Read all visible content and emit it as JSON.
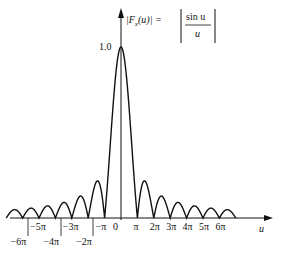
{
  "chart_data": {
    "type": "line",
    "xlabel": "u",
    "ylabel": "|F_x(u)|",
    "ylim": [
      0,
      1.0
    ],
    "xlim": [
      -7,
      7
    ],
    "x_unit": "pi",
    "grid": false,
    "legend": "none",
    "y_tick_labels": [
      "1.0"
    ],
    "x_tick_labels_upper": [
      "−5π",
      "−3π",
      "−π",
      "0",
      "π",
      "2π",
      "3π",
      "4π",
      "5π",
      "6π"
    ],
    "x_tick_labels_lower": [
      "−6π",
      "−4π",
      "−2π"
    ],
    "series": [
      {
        "name": "|sin u / u|",
        "x_zeros_pi": [
          -7,
          -6,
          -5,
          -4,
          -3,
          -2,
          -1,
          1,
          2,
          3,
          4,
          5,
          6,
          7
        ],
        "peak": 1.0,
        "sidelobe_peaks_approx": [
          0.217,
          0.128,
          0.091,
          0.071,
          0.058,
          0.049
        ]
      }
    ]
  },
  "labels": {
    "peak": "1.0",
    "u": "u",
    "formula_lhs": "|F",
    "formula_sub": "x",
    "formula_arg": "(u)| =",
    "formula_num": "sin u",
    "formula_den": "u",
    "upper": [
      "−5π",
      "−3π",
      "−π",
      "0",
      "π",
      "2π",
      "3π",
      "4π",
      "5π",
      "6π"
    ],
    "lower": [
      "−6π",
      "−4π",
      "−2π"
    ]
  }
}
